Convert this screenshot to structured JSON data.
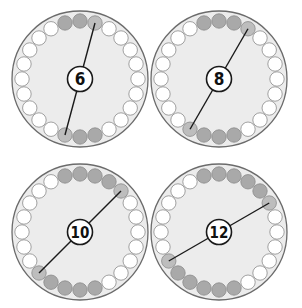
{
  "diagram": {
    "beads_per_ring": 24,
    "colors": {
      "outline": "#6b6b6b",
      "disc_fill": "#ececec",
      "bead_empty": "#ffffff",
      "bead_shaded": "#a9a9a9",
      "bead_shaded_end": "#bdbdbd",
      "line": "#1a1a1a",
      "label_fill": "#ffffff",
      "label_text": "#111111"
    },
    "circles": [
      {
        "id": "circle-6",
        "label": "6",
        "shaded_count": 6,
        "cx": 80,
        "cy": 79
      },
      {
        "id": "circle-8",
        "label": "8",
        "shaded_count": 8,
        "cx": 219,
        "cy": 79
      },
      {
        "id": "circle-10",
        "label": "10",
        "shaded_count": 10,
        "cx": 80,
        "cy": 232
      },
      {
        "id": "circle-12",
        "label": "12",
        "shaded_count": 12,
        "cx": 219,
        "cy": 232
      }
    ]
  }
}
